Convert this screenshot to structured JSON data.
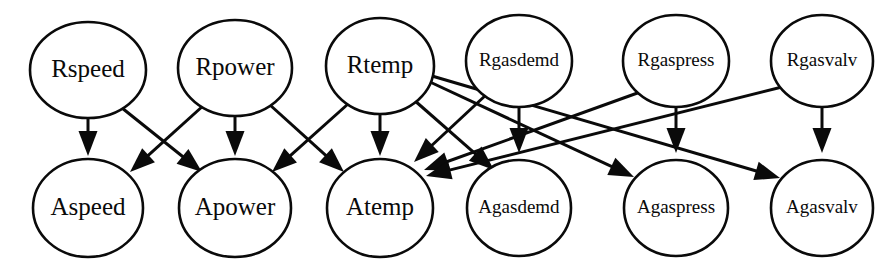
{
  "diagram": {
    "colors": {
      "background": "#ffffff",
      "node_fill": "#ffffff",
      "node_stroke": "#0a0a0a",
      "edge": "#0a0a0a"
    },
    "layers": {
      "top_label": "R",
      "bottom_label": "A"
    },
    "nodes": [
      {
        "id": "Rspeed",
        "label": "Rspeed",
        "row": "top",
        "cx": 88,
        "cy": 70,
        "rx": 58,
        "ry": 48,
        "font_size": 25
      },
      {
        "id": "Rpower",
        "label": "Rpower",
        "row": "top",
        "cx": 235,
        "cy": 68,
        "rx": 57,
        "ry": 48,
        "font_size": 25
      },
      {
        "id": "Rtemp",
        "label": "Rtemp",
        "row": "top",
        "cx": 380,
        "cy": 66,
        "rx": 54,
        "ry": 48,
        "font_size": 25
      },
      {
        "id": "Rgasdemd",
        "label": "Rgasdemd",
        "row": "top",
        "cx": 519,
        "cy": 61,
        "rx": 53,
        "ry": 46,
        "font_size": 19
      },
      {
        "id": "Rgaspress",
        "label": "Rgaspress",
        "row": "top",
        "cx": 676,
        "cy": 61,
        "rx": 53,
        "ry": 46,
        "font_size": 19
      },
      {
        "id": "Rgasvalv",
        "label": "Rgasvalv",
        "row": "top",
        "cx": 822,
        "cy": 61,
        "rx": 51,
        "ry": 46,
        "font_size": 19
      },
      {
        "id": "Aspeed",
        "label": "Aspeed",
        "row": "bottom",
        "cx": 88,
        "cy": 208,
        "rx": 55,
        "ry": 49,
        "font_size": 25
      },
      {
        "id": "Apower",
        "label": "Apower",
        "row": "bottom",
        "cx": 235,
        "cy": 208,
        "rx": 56,
        "ry": 49,
        "font_size": 25
      },
      {
        "id": "Atemp",
        "label": "Atemp",
        "row": "bottom",
        "cx": 380,
        "cy": 208,
        "rx": 53,
        "ry": 49,
        "font_size": 25
      },
      {
        "id": "Agasdemd",
        "label": "Agasdemd",
        "row": "bottom",
        "cx": 519,
        "cy": 208,
        "rx": 52,
        "ry": 48,
        "font_size": 19
      },
      {
        "id": "Agaspress",
        "label": "Agaspress",
        "row": "bottom",
        "cx": 676,
        "cy": 208,
        "rx": 52,
        "ry": 48,
        "font_size": 19
      },
      {
        "id": "Agasvalv",
        "label": "Agasvalv",
        "row": "bottom",
        "cx": 822,
        "cy": 208,
        "rx": 51,
        "ry": 48,
        "font_size": 19
      }
    ],
    "edges": [
      {
        "from": "Rspeed",
        "to": "Aspeed",
        "x1": 88,
        "y1": 118,
        "x2": 88,
        "y2": 156
      },
      {
        "from": "Rspeed",
        "to": "Apower",
        "x1": 122,
        "y1": 108,
        "x2": 202,
        "y2": 172
      },
      {
        "from": "Rpower",
        "to": "Aspeed",
        "x1": 204,
        "y1": 105,
        "x2": 130,
        "y2": 172
      },
      {
        "from": "Rpower",
        "to": "Apower",
        "x1": 235,
        "y1": 116,
        "x2": 235,
        "y2": 156
      },
      {
        "from": "Rpower",
        "to": "Atemp",
        "x1": 270,
        "y1": 105,
        "x2": 344,
        "y2": 172
      },
      {
        "from": "Rtemp",
        "to": "Apower",
        "x1": 348,
        "y1": 104,
        "x2": 272,
        "y2": 172
      },
      {
        "from": "Rtemp",
        "to": "Atemp",
        "x1": 380,
        "y1": 114,
        "x2": 380,
        "y2": 156
      },
      {
        "from": "Rtemp",
        "to": "Agasdemd",
        "x1": 414,
        "y1": 100,
        "x2": 494,
        "y2": 170
      },
      {
        "from": "Rtemp",
        "to": "Agaspress",
        "x1": 430,
        "y1": 82,
        "x2": 634,
        "y2": 177
      },
      {
        "from": "Rtemp",
        "to": "Agasvalv",
        "x1": 432,
        "y1": 76,
        "x2": 780,
        "y2": 178
      },
      {
        "from": "Rgasdemd",
        "to": "Atemp",
        "x1": 487,
        "y1": 94,
        "x2": 414,
        "y2": 162
      },
      {
        "from": "Rgasdemd",
        "to": "Agasdemd",
        "x1": 519,
        "y1": 107,
        "x2": 519,
        "y2": 153
      },
      {
        "from": "Rgaspress",
        "to": "Atemp",
        "x1": 643,
        "y1": 91,
        "x2": 424,
        "y2": 170
      },
      {
        "from": "Rgaspress",
        "to": "Agaspress",
        "x1": 676,
        "y1": 107,
        "x2": 676,
        "y2": 153
      },
      {
        "from": "Rgasvalv",
        "to": "Atemp",
        "x1": 786,
        "y1": 86,
        "x2": 426,
        "y2": 176
      },
      {
        "from": "Rgasvalv",
        "to": "Agasvalv",
        "x1": 822,
        "y1": 107,
        "x2": 822,
        "y2": 153
      }
    ]
  }
}
